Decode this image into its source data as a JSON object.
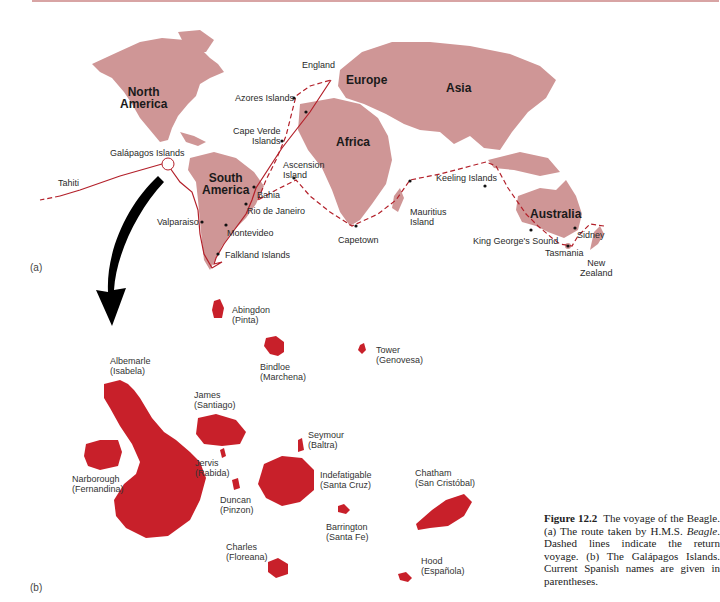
{
  "figure": {
    "number_label": "Figure 12.2",
    "caption_parts": [
      "The voyage of the Beagle. (a) The route taken by H.M.S. ",
      "Beagle",
      ". Dashed lines indicate the return voyage. (b) The Galápagos Islands. Current Spanish names are given in parentheses."
    ]
  },
  "panels": {
    "a": "(a)",
    "b": "(b)"
  },
  "continents": [
    {
      "id": "north-america",
      "line1": "North",
      "line2": "America"
    },
    {
      "id": "south-america",
      "line1": "South",
      "line2": "America"
    },
    {
      "id": "europe",
      "line1": "Europe"
    },
    {
      "id": "asia",
      "line1": "Asia"
    },
    {
      "id": "africa",
      "line1": "Africa"
    },
    {
      "id": "australia",
      "line1": "Australia"
    }
  ],
  "route_stops": [
    {
      "name": "England"
    },
    {
      "name": "Azores Islands"
    },
    {
      "name": "Cape Verde",
      "name2": "Islands"
    },
    {
      "name": "Galápagos Islands"
    },
    {
      "name": "Tahiti"
    },
    {
      "name": "Ascension",
      "name2": "Island"
    },
    {
      "name": "Bahia"
    },
    {
      "name": "Rio de Janeiro"
    },
    {
      "name": "Valparaiso"
    },
    {
      "name": "Montevideo"
    },
    {
      "name": "Falkland Islands"
    },
    {
      "name": "Capetown"
    },
    {
      "name": "Mauritius",
      "name2": "Island"
    },
    {
      "name": "Keeling Islands"
    },
    {
      "name": "King George's Sound"
    },
    {
      "name": "Tasmania"
    },
    {
      "name": "Sidney"
    },
    {
      "name": "New",
      "name2": "Zealand"
    }
  ],
  "islands": [
    {
      "english": "Abingdon",
      "spanish": "(Pinta)"
    },
    {
      "english": "Tower",
      "spanish": "(Genovesa)"
    },
    {
      "english": "Bindloe",
      "spanish": "(Marchena)"
    },
    {
      "english": "Albemarle",
      "spanish": "(Isabela)"
    },
    {
      "english": "James",
      "spanish": "(Santiago)"
    },
    {
      "english": "Seymour",
      "spanish": "(Baltra)"
    },
    {
      "english": "Jervis",
      "spanish": "(Rabida)"
    },
    {
      "english": "Narborough",
      "spanish": "(Fernandina)"
    },
    {
      "english": "Indefatigable",
      "spanish": "(Santa Cruz)"
    },
    {
      "english": "Chatham",
      "spanish": "(San Cristóbal)"
    },
    {
      "english": "Duncan",
      "spanish": "(Pinzon)"
    },
    {
      "english": "Barrington",
      "spanish": "(Santa Fe)"
    },
    {
      "english": "Charles",
      "spanish": "(Floreana)"
    },
    {
      "english": "Hood",
      "spanish": "(Española)"
    }
  ],
  "colors": {
    "land": "#cf9696",
    "route": "#b3202a",
    "island": "#c8202a",
    "arrow": "#000000"
  }
}
